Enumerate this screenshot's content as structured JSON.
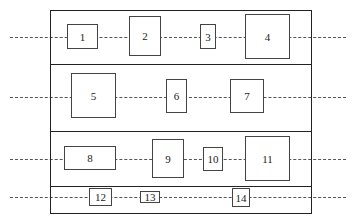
{
  "diagram": {
    "type": "block-layout",
    "frame": {
      "x": 50,
      "y": 10,
      "w": 262,
      "h": 204
    },
    "row_dividers_y": [
      64,
      131,
      186
    ],
    "rows": [
      {
        "id": "row-1",
        "center_y": 37,
        "boxes": [
          "1",
          "2",
          "3",
          "4"
        ]
      },
      {
        "id": "row-2",
        "center_y": 97,
        "boxes": [
          "5",
          "6",
          "7"
        ]
      },
      {
        "id": "row-3",
        "center_y": 159,
        "boxes": [
          "8",
          "9",
          "10",
          "11"
        ]
      },
      {
        "id": "row-4",
        "center_y": 197,
        "boxes": [
          "12",
          "13",
          "14"
        ]
      }
    ],
    "boxes": [
      {
        "label": "1",
        "x": 67,
        "y": 24,
        "w": 31,
        "h": 25
      },
      {
        "label": "2",
        "x": 129,
        "y": 16,
        "w": 32,
        "h": 40
      },
      {
        "label": "3",
        "x": 200,
        "y": 24,
        "w": 16,
        "h": 25
      },
      {
        "label": "4",
        "x": 245,
        "y": 14,
        "w": 45,
        "h": 45
      },
      {
        "label": "5",
        "x": 71,
        "y": 73,
        "w": 45,
        "h": 45
      },
      {
        "label": "6",
        "x": 166,
        "y": 79,
        "w": 21,
        "h": 34
      },
      {
        "label": "7",
        "x": 230,
        "y": 79,
        "w": 34,
        "h": 34
      },
      {
        "label": "8",
        "x": 64,
        "y": 146,
        "w": 52,
        "h": 24
      },
      {
        "label": "9",
        "x": 152,
        "y": 139,
        "w": 32,
        "h": 39
      },
      {
        "label": "10",
        "x": 203,
        "y": 147,
        "w": 20,
        "h": 24
      },
      {
        "label": "11",
        "x": 245,
        "y": 136,
        "w": 45,
        "h": 45
      },
      {
        "label": "12",
        "x": 89,
        "y": 188,
        "w": 23,
        "h": 18
      },
      {
        "label": "13",
        "x": 140,
        "y": 191,
        "w": 20,
        "h": 12
      },
      {
        "label": "14",
        "x": 232,
        "y": 188,
        "w": 18,
        "h": 19
      }
    ],
    "dash_line": {
      "x_start": 10,
      "x_end": 346
    }
  }
}
